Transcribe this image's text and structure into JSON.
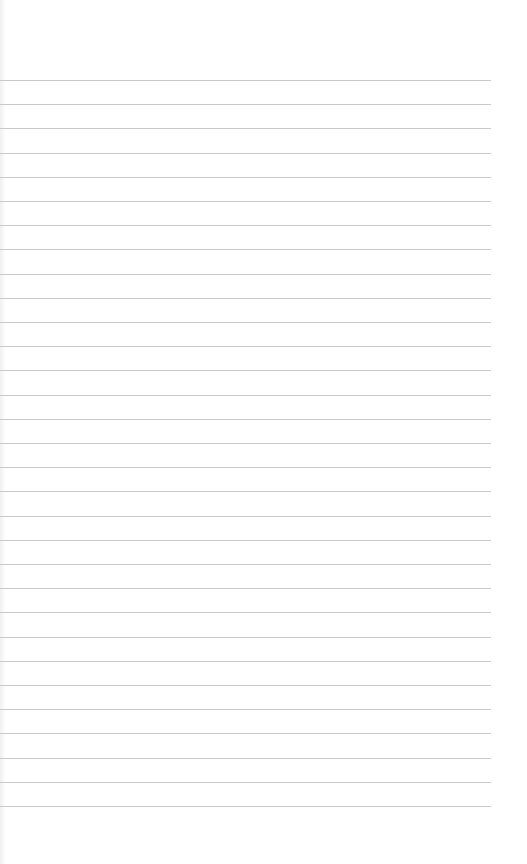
{
  "page": {
    "type": "blank ruled notepaper",
    "background_color": "#ffffff",
    "rule_color": "#c9c9c9",
    "rules": {
      "count": 31,
      "first_y": 80,
      "spacing": 24.2,
      "left_x": 0,
      "right_x": 491
    },
    "text_content": []
  }
}
